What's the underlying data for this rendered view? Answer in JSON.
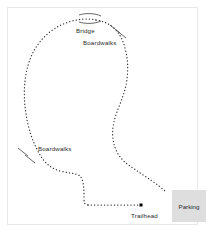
{
  "map": {
    "type": "trail-map",
    "background_color": "#ffffff",
    "frame_color": "#e8e8e8",
    "trail_color": "#333333",
    "trail_style": "dotted",
    "labels": [
      {
        "id": "bridge",
        "text": "Bridge",
        "x": 76,
        "y": 27
      },
      {
        "id": "boardwalks-top",
        "text": "Boardwalks",
        "x": 83,
        "y": 39
      },
      {
        "id": "boardwalks-left",
        "text": "Boardwalks",
        "x": 38,
        "y": 145
      },
      {
        "id": "trailhead",
        "text": "Trailhead",
        "x": 131,
        "y": 212
      }
    ],
    "parking": {
      "label": "Parking",
      "fill_color": "#dedede",
      "x": 172,
      "y": 190,
      "width": 34,
      "height": 32
    },
    "trailhead_marker": {
      "name": "trailhead-marker",
      "x": 141,
      "y": 205,
      "size": 3,
      "color": "#000000"
    },
    "features": {
      "bridge_arcs": 2,
      "boardwalk_tick_groups": 2,
      "boardwalk_ticks_per_group": 2
    },
    "trail_paths": {
      "main_loop": "M 96 20 C 88 18, 76 19, 66 23 C 55 27, 46 34, 39 43 C 32 52, 28 63, 26 74 C 24 85, 24 96, 25 106 C 26 116, 28 126, 31 135 C 34 144, 38 152, 42 158 C 47 165, 53 169, 60 171 C 68 173, 76 173, 80 176 C 84 180, 84 190, 84 199 C 84 203, 85 205, 88 205",
      "east_branch": "M 96 20 C 103 21, 110 24, 115 29 C 121 35, 124 43, 126 52 C 128 61, 128 70, 127 79 C 126 88, 123 96, 120 104 C 117 112, 114 119, 113 127 C 112 135, 113 143, 116 150 C 119 157, 124 162, 130 166 C 137 171, 145 176, 152 181 C 158 185, 163 189, 166 192",
      "bottom_connector": "M 88 205 L 141 205",
      "bridge_arc_upper": "M 79 15 C 85 13, 95 13, 101 16",
      "bridge_arc_lower": "M 79 22 C 85 24, 95 24, 101 21"
    },
    "boardwalk_ticks": [
      {
        "x1": 110,
        "y1": 25,
        "x2": 120,
        "y2": 33
      },
      {
        "x1": 116,
        "y1": 30,
        "x2": 126,
        "y2": 38
      },
      {
        "x1": 18,
        "y1": 148,
        "x2": 28,
        "y2": 156
      },
      {
        "x1": 25,
        "y1": 155,
        "x2": 35,
        "y2": 163
      }
    ]
  }
}
